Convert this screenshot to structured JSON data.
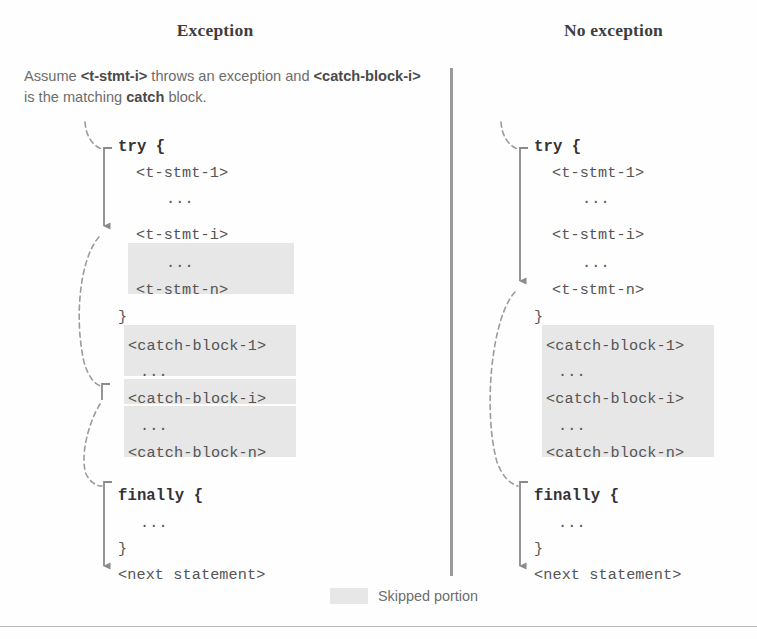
{
  "figure": {
    "columns": {
      "left_title": "Exception",
      "right_title": "No exception"
    },
    "assumption": {
      "prefix": "Assume ",
      "token1": "<t-stmt-i>",
      "middle": " throws an exception and ",
      "token2": "<catch-block-i>",
      "middle2": " is the matching ",
      "keyword": "catch",
      "suffix": " block."
    },
    "legend": {
      "label": "Skipped portion",
      "swatch_color": "#e7e7e7"
    },
    "colors": {
      "highlight": "#e7e7e7",
      "code_text": "#555555",
      "keyword_text": "#333333",
      "prose_text": "#6d6d6d",
      "title_text": "#3e3e3e",
      "flow_line": "#8a8a8a",
      "divider": "#9a9a9a"
    },
    "code_lines": {
      "try_open": "try {",
      "t_stmt_1": "<t-stmt-1>",
      "ellipsis": "...",
      "t_stmt_i": "<t-stmt-i>",
      "t_stmt_n": "<t-stmt-n>",
      "close_brace": "}",
      "catch_block_1": "<catch-block-1>",
      "catch_block_i": "<catch-block-i>",
      "catch_block_n": "<catch-block-n>",
      "finally_open": "finally {",
      "next_statement": "<next statement>"
    },
    "left_panel": {
      "lines": [
        {
          "text": "try {",
          "keyword": true,
          "x": 118,
          "y": 138
        },
        {
          "text": "<t-stmt-1>",
          "keyword": false,
          "x": 136,
          "y": 164
        },
        {
          "text": "...",
          "keyword": false,
          "x": 166,
          "y": 190
        },
        {
          "text": "<t-stmt-i>",
          "keyword": false,
          "x": 136,
          "y": 226
        },
        {
          "text": "...",
          "keyword": false,
          "x": 166,
          "y": 254
        },
        {
          "text": "<t-stmt-n>",
          "keyword": false,
          "x": 136,
          "y": 281
        },
        {
          "text": "}",
          "keyword": false,
          "x": 118,
          "y": 308
        },
        {
          "text": "<catch-block-1>",
          "keyword": false,
          "x": 128,
          "y": 337
        },
        {
          "text": "...",
          "keyword": false,
          "x": 140,
          "y": 363
        },
        {
          "text": "<catch-block-i>",
          "keyword": false,
          "x": 128,
          "y": 390
        },
        {
          "text": "...",
          "keyword": false,
          "x": 140,
          "y": 417
        },
        {
          "text": "<catch-block-n>",
          "keyword": false,
          "x": 128,
          "y": 444
        },
        {
          "text": "finally {",
          "keyword": true,
          "x": 118,
          "y": 487
        },
        {
          "text": "...",
          "keyword": false,
          "x": 140,
          "y": 514
        },
        {
          "text": "}",
          "keyword": false,
          "x": 118,
          "y": 540
        },
        {
          "text": "<next statement>",
          "keyword": false,
          "x": 118,
          "y": 566
        }
      ],
      "highlights": [
        {
          "x": 128,
          "y": 243,
          "w": 166,
          "h": 51
        },
        {
          "x": 124,
          "y": 325,
          "w": 172,
          "h": 51
        },
        {
          "x": 124,
          "y": 379,
          "w": 172,
          "h": 25
        },
        {
          "x": 124,
          "y": 406,
          "w": 172,
          "h": 51
        }
      ]
    },
    "right_panel": {
      "lines": [
        {
          "text": "try {",
          "keyword": true,
          "x": 81,
          "y": 138
        },
        {
          "text": "<t-stmt-1>",
          "keyword": false,
          "x": 99,
          "y": 164
        },
        {
          "text": "...",
          "keyword": false,
          "x": 129,
          "y": 190
        },
        {
          "text": "<t-stmt-i>",
          "keyword": false,
          "x": 99,
          "y": 226
        },
        {
          "text": "...",
          "keyword": false,
          "x": 129,
          "y": 254
        },
        {
          "text": "<t-stmt-n>",
          "keyword": false,
          "x": 99,
          "y": 281
        },
        {
          "text": "}",
          "keyword": false,
          "x": 81,
          "y": 308
        },
        {
          "text": "<catch-block-1>",
          "keyword": false,
          "x": 93,
          "y": 337
        },
        {
          "text": "...",
          "keyword": false,
          "x": 105,
          "y": 363
        },
        {
          "text": "<catch-block-i>",
          "keyword": false,
          "x": 93,
          "y": 390
        },
        {
          "text": "...",
          "keyword": false,
          "x": 105,
          "y": 417
        },
        {
          "text": "<catch-block-n>",
          "keyword": false,
          "x": 93,
          "y": 444
        },
        {
          "text": "finally {",
          "keyword": true,
          "x": 81,
          "y": 487
        },
        {
          "text": "...",
          "keyword": false,
          "x": 105,
          "y": 514
        },
        {
          "text": "}",
          "keyword": false,
          "x": 81,
          "y": 540
        },
        {
          "text": "<next statement>",
          "keyword": false,
          "x": 81,
          "y": 566
        }
      ],
      "highlights": [
        {
          "x": 89,
          "y": 325,
          "w": 172,
          "h": 132
        }
      ]
    }
  }
}
